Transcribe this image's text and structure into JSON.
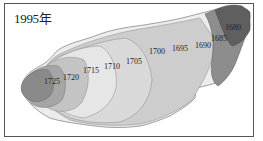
{
  "map": {
    "title": "1995年",
    "isolines": [
      {
        "label": "1725",
        "x": 44,
        "y": 84,
        "fill": "#8c8c8c"
      },
      {
        "label": "1720",
        "x": 60,
        "y": 80,
        "fill": "#b3b3b3"
      },
      {
        "label": "1715",
        "x": 83,
        "y": 73,
        "fill": "#e4e4e4"
      },
      {
        "label": "1710",
        "x": 105,
        "y": 70,
        "fill": "#d6d6d6"
      },
      {
        "label": "1705",
        "x": 127,
        "y": 65,
        "fill": "#cfcfcf"
      },
      {
        "label": "1700",
        "x": 150,
        "y": 55,
        "fill": "#c8c8c8"
      },
      {
        "label": "1695",
        "x": 172,
        "y": 50,
        "fill": "#c3c3c3"
      },
      {
        "label": "1690",
        "x": 196,
        "y": 48,
        "fill": "#d2d2d2"
      },
      {
        "label": "1685",
        "x": 213,
        "y": 40,
        "fill": "#a9a9a9"
      },
      {
        "label": "1680",
        "x": 226,
        "y": 30,
        "fill": "#6c6c6c"
      }
    ]
  }
}
